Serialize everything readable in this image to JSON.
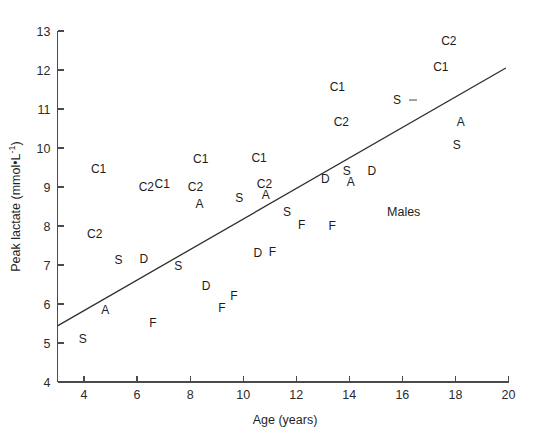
{
  "figure": {
    "width": 536,
    "height": 438,
    "background": "#ffffff",
    "ink_color": "#1c1c1c",
    "axis_color": "#4a4a4a"
  },
  "chart_data": {
    "type": "scatter",
    "title": "",
    "xlabel": "Age (years)",
    "ylabel": "Peak lactate (mmol•L⁻¹)",
    "ylabel_parts": {
      "main": "Peak lactate (mmol•L",
      "superscript": "-1",
      "tail": ")"
    },
    "xlim": [
      3,
      20
    ],
    "ylim": [
      4,
      13
    ],
    "xticks": [
      4,
      6,
      8,
      10,
      12,
      14,
      16,
      18,
      20
    ],
    "xtick_labels": [
      "4",
      "6",
      "8",
      "10",
      "12",
      "14",
      "16",
      "18",
      "20"
    ],
    "yticks": [
      4,
      5,
      6,
      7,
      8,
      9,
      10,
      11,
      12,
      13
    ],
    "ytick_labels": [
      "4",
      "5",
      "6",
      "7",
      "8",
      "9",
      "10",
      "11",
      "12",
      "13"
    ],
    "grid": false,
    "legend": "none",
    "marker_style": "text-label",
    "annotations": [
      {
        "text": "Males",
        "x": 16.05,
        "y": 8.35,
        "name": "males-group-label"
      }
    ],
    "trendline": {
      "name": "regression-line",
      "x": [
        3.0,
        19.9
      ],
      "y": [
        5.44,
        12.05
      ],
      "slope": 0.391,
      "intercept": 4.27
    },
    "points": [
      {
        "label": "S",
        "x": 3.95,
        "y": 5.08
      },
      {
        "label": "A",
        "x": 4.8,
        "y": 5.82
      },
      {
        "label": "C2",
        "x": 4.4,
        "y": 7.77
      },
      {
        "label": "C1",
        "x": 4.55,
        "y": 9.45
      },
      {
        "label": "S",
        "x": 5.3,
        "y": 7.1
      },
      {
        "label": "D",
        "x": 6.25,
        "y": 7.12
      },
      {
        "label": "F",
        "x": 6.6,
        "y": 5.5
      },
      {
        "label": "C2",
        "x": 6.35,
        "y": 8.98
      },
      {
        "label": "C1",
        "x": 6.95,
        "y": 9.06
      },
      {
        "label": "S",
        "x": 7.55,
        "y": 6.95
      },
      {
        "label": "D",
        "x": 8.6,
        "y": 6.45
      },
      {
        "label": "C2",
        "x": 8.2,
        "y": 8.98
      },
      {
        "label": "C1",
        "x": 8.4,
        "y": 9.7
      },
      {
        "label": "A",
        "x": 8.35,
        "y": 8.55
      },
      {
        "label": "F",
        "x": 9.2,
        "y": 5.88
      },
      {
        "label": "F",
        "x": 9.65,
        "y": 6.18
      },
      {
        "label": "S",
        "x": 9.85,
        "y": 8.7
      },
      {
        "label": "C1",
        "x": 10.6,
        "y": 9.72
      },
      {
        "label": "A",
        "x": 10.85,
        "y": 8.78
      },
      {
        "label": "C2",
        "x": 10.8,
        "y": 9.06
      },
      {
        "label": "D",
        "x": 10.55,
        "y": 7.28
      },
      {
        "label": "F",
        "x": 11.1,
        "y": 7.3
      },
      {
        "label": "S",
        "x": 11.65,
        "y": 8.35
      },
      {
        "label": "F",
        "x": 12.2,
        "y": 8.0
      },
      {
        "label": "D",
        "x": 13.1,
        "y": 9.18
      },
      {
        "label": "F",
        "x": 13.35,
        "y": 7.98
      },
      {
        "label": "C1",
        "x": 13.55,
        "y": 11.55
      },
      {
        "label": "C2",
        "x": 13.7,
        "y": 10.65
      },
      {
        "label": "S",
        "x": 13.9,
        "y": 9.38
      },
      {
        "label": "A",
        "x": 14.05,
        "y": 9.1
      },
      {
        "label": "D",
        "x": 14.85,
        "y": 9.38
      },
      {
        "label": "S",
        "x": 15.8,
        "y": 11.2
      },
      {
        "label": "C2",
        "x": 17.75,
        "y": 12.72
      },
      {
        "label": "C1",
        "x": 17.45,
        "y": 12.05
      },
      {
        "label": "A",
        "x": 18.2,
        "y": 10.65
      },
      {
        "label": "S",
        "x": 18.05,
        "y": 10.05
      }
    ]
  }
}
